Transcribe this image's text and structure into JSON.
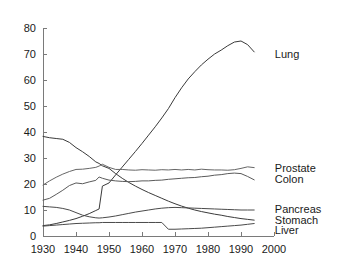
{
  "chart_data": {
    "type": "line",
    "title": "",
    "subtitle": "",
    "xlabel": "",
    "ylabel": "",
    "xlim": [
      1930,
      2000
    ],
    "ylim": [
      0,
      80
    ],
    "x_ticks": [
      1930,
      1940,
      1950,
      1960,
      1970,
      1980,
      1990,
      2000
    ],
    "y_ticks": [
      0,
      10,
      20,
      30,
      40,
      50,
      60,
      70,
      80
    ],
    "grid": false,
    "legend_position": "right-inline-labels",
    "annotations": [
      "Lung shows a sharp step increase at 1948",
      "Liver shows a sharp step decrease at 1968",
      "Prostate and Colon cross near 1988"
    ],
    "x": [
      1930,
      1932,
      1934,
      1936,
      1938,
      1940,
      1942,
      1944,
      1946,
      1947,
      1948,
      1950,
      1952,
      1954,
      1956,
      1958,
      1960,
      1962,
      1964,
      1966,
      1968,
      1970,
      1972,
      1974,
      1976,
      1978,
      1980,
      1982,
      1984,
      1986,
      1988,
      1990,
      1992,
      1994
    ],
    "series": [
      {
        "name": "Lung",
        "label": "Lung",
        "color": "#3a3a3a",
        "label_x": 1996,
        "label_y": 70,
        "values": [
          4.0,
          4.3,
          4.8,
          5.4,
          6.0,
          6.7,
          7.6,
          8.6,
          9.8,
          10.4,
          19.2,
          20.4,
          23.5,
          26.5,
          29.5,
          32.5,
          35.6,
          38.8,
          42.0,
          45.4,
          49.0,
          53.2,
          57.0,
          60.4,
          63.2,
          65.8,
          68.0,
          70.0,
          71.5,
          73.2,
          74.6,
          75.0,
          73.6,
          70.8
        ]
      },
      {
        "name": "Stomach",
        "label": "Stomach",
        "color": "#3a3a3a",
        "label_x": 1996,
        "label_y": 6,
        "values": [
          38.3,
          37.8,
          37.5,
          37.2,
          36.0,
          34.0,
          32.4,
          30.6,
          28.5,
          27.9,
          27.0,
          26.0,
          24.0,
          22.2,
          20.6,
          19.2,
          17.9,
          16.7,
          15.6,
          14.5,
          13.4,
          12.4,
          11.5,
          10.7,
          10.0,
          9.4,
          8.9,
          8.4,
          8.0,
          7.5,
          7.1,
          6.7,
          6.4,
          6.1
        ]
      },
      {
        "name": "Prostate",
        "label": "Prostate",
        "color": "#666666",
        "label_x": 1996,
        "label_y": 26,
        "values": [
          19.6,
          21.2,
          22.6,
          23.8,
          24.8,
          25.6,
          25.7,
          26.0,
          26.4,
          26.9,
          27.6,
          26.4,
          25.6,
          25.6,
          25.4,
          25.3,
          25.5,
          25.4,
          25.3,
          25.5,
          25.4,
          25.6,
          25.4,
          25.6,
          25.4,
          25.7,
          25.5,
          25.4,
          25.4,
          25.3,
          25.5,
          26.0,
          26.6,
          26.3
        ]
      },
      {
        "name": "Colon",
        "label": "Colon",
        "color": "#5a5a5a",
        "label_x": 1996,
        "label_y": 22,
        "values": [
          13.8,
          14.5,
          16.0,
          17.6,
          19.4,
          20.4,
          20.1,
          20.8,
          21.4,
          22.7,
          22.2,
          21.5,
          21.2,
          21.0,
          20.9,
          21.0,
          21.2,
          21.2,
          21.4,
          21.5,
          21.8,
          22.0,
          22.2,
          22.4,
          22.5,
          22.8,
          23.0,
          23.4,
          23.6,
          24.0,
          24.2,
          24.0,
          22.9,
          21.6
        ]
      },
      {
        "name": "Pancreas",
        "label": "Pancreas",
        "color": "#4a4a4a",
        "label_x": 1996,
        "label_y": 10.5,
        "values": [
          11.4,
          11.2,
          11.0,
          10.6,
          10.0,
          9.0,
          8.0,
          7.4,
          7.0,
          6.9,
          7.0,
          7.3,
          7.7,
          8.2,
          8.7,
          9.2,
          9.6,
          10.0,
          10.4,
          10.7,
          10.9,
          11.0,
          10.9,
          10.8,
          10.7,
          10.6,
          10.5,
          10.4,
          10.3,
          10.2,
          10.1,
          10.0,
          10.0,
          10.0
        ]
      },
      {
        "name": "Liver",
        "label": "Liver",
        "color": "#4a4a4a",
        "label_x": 1996,
        "label_y": 2.5,
        "values": [
          3.8,
          4.0,
          4.2,
          4.4,
          4.6,
          4.8,
          4.9,
          5.0,
          5.1,
          5.1,
          5.2,
          5.2,
          5.2,
          5.2,
          5.2,
          5.2,
          5.2,
          5.2,
          5.2,
          5.2,
          2.6,
          2.6,
          2.7,
          2.8,
          2.9,
          3.0,
          3.2,
          3.4,
          3.6,
          3.8,
          4.0,
          4.2,
          4.5,
          4.8
        ]
      }
    ]
  },
  "axes": {
    "x_tick_labels": [
      "1930",
      "1940",
      "1950",
      "1960",
      "1970",
      "1980",
      "1990",
      "2000"
    ],
    "y_tick_labels": [
      "0",
      "10",
      "20",
      "30",
      "40",
      "50",
      "60",
      "70",
      "80"
    ]
  },
  "labels": {
    "lung": "Lung",
    "prostate": "Prostate",
    "colon": "Colon",
    "pancreas": "Pancreas",
    "stomach": "Stomach",
    "liver": "Liver"
  },
  "colors": {
    "axis": "#7a7a7a",
    "text": "#1a1a1a",
    "background": "#ffffff",
    "line_dark": "#3a3a3a",
    "line_mid": "#5a5a5a",
    "line_light": "#666666"
  }
}
